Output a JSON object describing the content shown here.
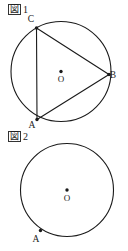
{
  "page": {
    "background_color": "#ffffff",
    "ink_color": "#1a1a1a",
    "width": 128,
    "height": 251
  },
  "figures": [
    {
      "id": "figure-1",
      "caption_kanji": "図",
      "caption_number": "1",
      "circle": {
        "cx": 61,
        "cy": 71.5,
        "r": 50
      },
      "center_point": {
        "label": "O",
        "x": 61,
        "y": 71.5,
        "label_x": 61,
        "label_y": 82
      },
      "vertices": [
        {
          "name": "C",
          "x": 36.5,
          "y": 28.0,
          "label_x": 31,
          "label_y": 22
        },
        {
          "name": "B",
          "x": 109.0,
          "y": 74.5,
          "label_x": 113,
          "label_y": 78
        },
        {
          "name": "A",
          "x": 37.0,
          "y": 119.5,
          "label_x": 32,
          "label_y": 128
        }
      ],
      "chords": [
        {
          "name": "chord-CA",
          "from": "C",
          "to": "A"
        },
        {
          "name": "chord-CB",
          "from": "C",
          "to": "B"
        },
        {
          "name": "chord-AB",
          "from": "A",
          "to": "B"
        }
      ]
    },
    {
      "id": "figure-2",
      "caption_kanji": "図",
      "caption_number": "2",
      "circle": {
        "cx": 67,
        "cy": 190,
        "r": 46.5
      },
      "center_point": {
        "label": "O",
        "x": 67,
        "y": 190,
        "label_x": 67,
        "label_y": 200.5
      },
      "vertices": [
        {
          "name": "A",
          "x": 40.5,
          "y": 230.5,
          "label_x": 36,
          "label_y": 242
        }
      ],
      "chords": []
    }
  ]
}
